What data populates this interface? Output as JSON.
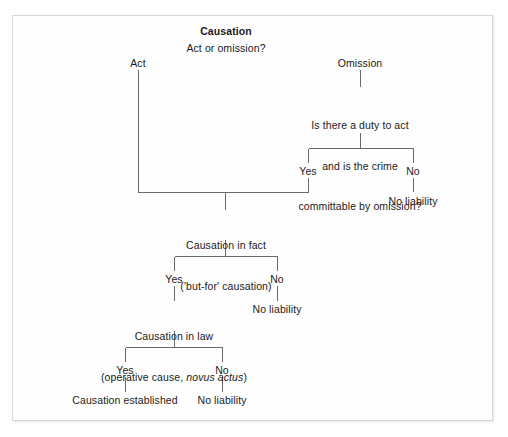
{
  "diagram": {
    "title": "Causation",
    "root_question": "Act or omission?",
    "nodes": {
      "title": "Causation",
      "root_question": "Act or omission?",
      "act": "Act",
      "omission": "Omission",
      "duty_question_line1": "Is there a duty to act",
      "duty_question_line2": "and is the crime",
      "duty_question_line3": "committable by omission?",
      "duty_yes": "Yes",
      "duty_no": "No",
      "duty_no_liability": "No liability",
      "fact_line1": "Causation in fact",
      "fact_line2": "('but-for' causation)",
      "fact_yes": "Yes",
      "fact_no": "No",
      "fact_no_liability": "No liability",
      "law_line1": "Causation in law",
      "law_line2_pre": "(operative cause, ",
      "law_line2_italic": "novus actus",
      "law_line2_post": ")",
      "law_yes": "Yes",
      "law_no": "No",
      "established": "Causation established",
      "law_no_liability": "No liability"
    },
    "colors": {
      "line": "#6b6b6b",
      "text": "#1b1b1b",
      "background": "#ffffff",
      "frame_border": "#d8d8d8"
    }
  }
}
